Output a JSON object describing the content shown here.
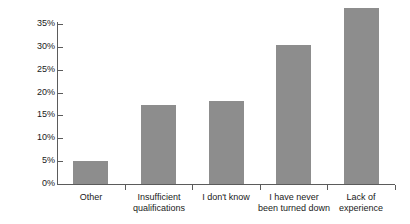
{
  "chart_data": {
    "type": "bar",
    "title": "",
    "subtitle": "",
    "xlabel": "",
    "ylabel": "",
    "categories": [
      "Other",
      "Insufficient\nqualifications",
      "I don't know",
      "I have never\nbeen turned down",
      "Lack of\nexperience"
    ],
    "values": [
      5,
      17.3,
      18.2,
      30.5,
      38.5
    ],
    "value_labels": [
      "5%",
      "17.3%",
      "18.2%",
      "30.5%",
      "38.5%"
    ],
    "ylim": [
      0,
      35
    ],
    "ytick_labels": [
      "0%",
      "5%",
      "10%",
      "15%",
      "20%",
      "25%",
      "30%",
      "35%"
    ],
    "ytick_values": [
      0,
      5,
      10,
      15,
      20,
      25,
      30,
      35
    ],
    "grid": false,
    "legend": false,
    "legend_position": "none",
    "series": [
      {
        "name": "Share of respondents",
        "values": [
          5,
          17.3,
          18.2,
          30.5,
          38.5
        ]
      }
    ],
    "colors": {
      "bar_fill": "#8d8d8d",
      "axis": "#5b5b5b",
      "text": "#1a1a1a",
      "background": "#ffffff"
    }
  }
}
